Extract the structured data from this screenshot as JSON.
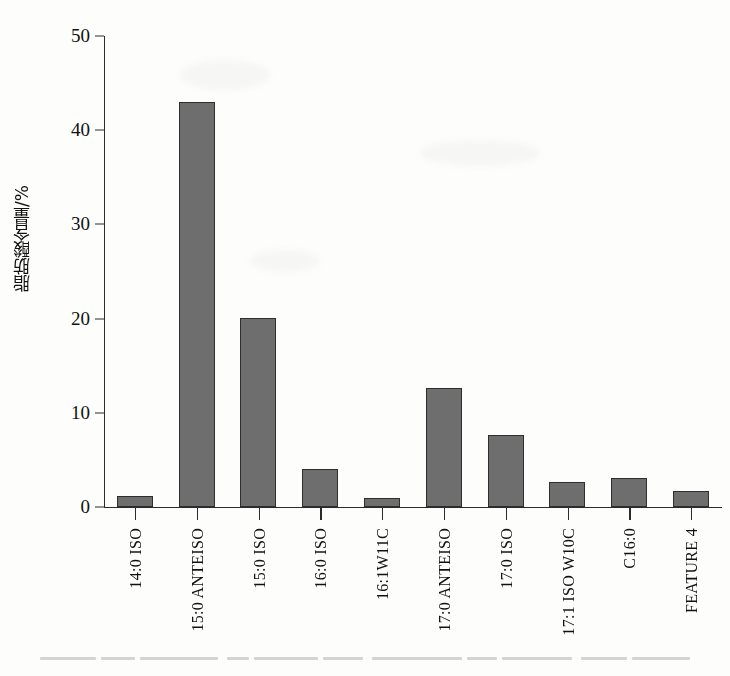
{
  "chart_data": {
    "type": "bar",
    "title": "",
    "xlabel": "",
    "ylabel": "脂肪酸含量/%",
    "ylim": [
      0,
      50
    ],
    "yticks": [
      0,
      10,
      20,
      30,
      40,
      50
    ],
    "ytick_labels": [
      "0",
      "10",
      "20",
      "30",
      "40",
      "50"
    ],
    "grid": false,
    "legend": "none",
    "bar_color": "#6e6e6e",
    "bar_edge_color": "#2e2e2e",
    "axis_color": "#2b2b2b",
    "categories": [
      "14:0 ISO",
      "15:0 ANTEISO",
      "15:0 ISO",
      "16:0 ISO",
      "16:1W11C",
      "17:0 ANTEISO",
      "17:0 ISO",
      "17:1 ISO W10C",
      "C16:0",
      "FEATURE 4"
    ],
    "values": [
      1.2,
      43.0,
      20.1,
      4.0,
      1.0,
      12.6,
      7.6,
      2.7,
      3.1,
      1.7
    ]
  }
}
